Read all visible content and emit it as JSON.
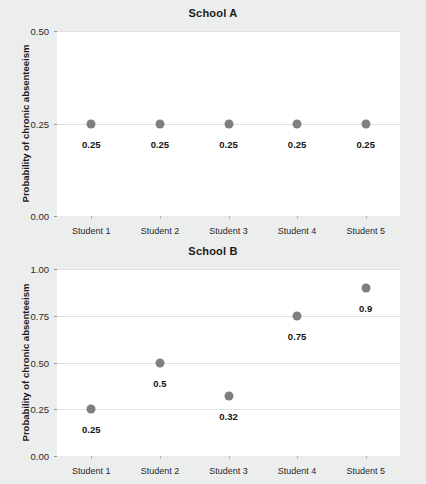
{
  "figure": {
    "background_color": "#eceded",
    "panel_color": "#ffffff",
    "grid_color": "#e2e2e2",
    "point_color": "#7f7f7f",
    "axis_title": "Probability of chronic absenteeism"
  },
  "chart_data": [
    {
      "type": "scatter",
      "title": "School A",
      "xlabel": "",
      "ylabel": "Probability of chronic absenteeism",
      "categories": [
        "Student 1",
        "Student 2",
        "Student 3",
        "Student 4",
        "Student 5"
      ],
      "values": [
        0.25,
        0.25,
        0.25,
        0.25,
        0.25
      ],
      "point_labels": [
        "0.25",
        "0.25",
        "0.25",
        "0.25",
        "0.25"
      ],
      "yticks": [
        0.0,
        0.25,
        0.5
      ],
      "ytick_labels": [
        "0.00",
        "0.25",
        "0.50"
      ],
      "ylim": [
        0.0,
        0.5
      ],
      "grid": true,
      "legend": "none"
    },
    {
      "type": "scatter",
      "title": "School B",
      "xlabel": "",
      "ylabel": "Probability of chronic absenteeism",
      "categories": [
        "Student 1",
        "Student 2",
        "Student 3",
        "Student 4",
        "Student 5"
      ],
      "values": [
        0.25,
        0.5,
        0.32,
        0.75,
        0.9
      ],
      "point_labels": [
        "0.25",
        "0.5",
        "0.32",
        "0.75",
        "0.9"
      ],
      "yticks": [
        0.0,
        0.25,
        0.5,
        0.75,
        1.0
      ],
      "ytick_labels": [
        "0.00",
        "0.25",
        "0.50",
        "0.75",
        "1.00"
      ],
      "ylim": [
        0.0,
        1.0
      ],
      "grid": true,
      "legend": "none"
    }
  ]
}
